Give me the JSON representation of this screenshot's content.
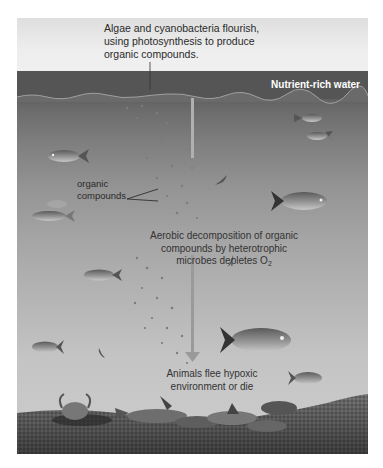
{
  "diagram": {
    "labels": {
      "top_caption_line1": "Algae and cyanobacteria flourish,",
      "top_caption_line2": "using photosynthesis to produce",
      "top_caption_line3": "organic compounds.",
      "nutrient_water": "Nutrient-rich water",
      "organic_line1": "organic",
      "organic_line2": "compounds",
      "aerobic_line1": "Aerobic decomposition of organic",
      "aerobic_line2": "compounds by heterotrophic",
      "aerobic_line3_prefix": "microbes depletes O",
      "aerobic_line3_sub": "2",
      "animals_line1": "Animals flee hypoxic",
      "animals_line2": "environment or die"
    },
    "icons": [
      "fish-icon",
      "shrimp-icon",
      "crab-icon",
      "down-arrow-icon"
    ],
    "colors": {
      "surface_band": "#545454",
      "water_top": "#6b6b6b",
      "water_bottom": "#cdcdcd",
      "sediment": "#5a5a5a",
      "arrow": "#9a9a9a"
    }
  }
}
